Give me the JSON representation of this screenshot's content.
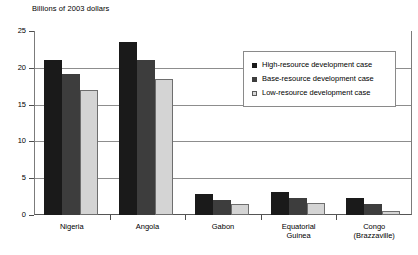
{
  "chart_data": {
    "type": "bar",
    "title": "Billions of 2003 dollars",
    "xlabel": "",
    "ylabel": "Billions of 2003 dollars",
    "ylim": [
      0,
      25
    ],
    "yticks": [
      0,
      5,
      10,
      15,
      20,
      25
    ],
    "grid": true,
    "legend_position": "inside-top-right",
    "categories": [
      "Nigeria",
      "Angola",
      "Gabon",
      "Equatorial\nGuinea",
      "Congo\n(Brazzaville)"
    ],
    "series": [
      {
        "name": "High-resource development case",
        "color": "#1a1a1a",
        "values": [
          21.0,
          23.5,
          2.8,
          3.1,
          2.3
        ]
      },
      {
        "name": "Base-resource development case",
        "color": "#3d3d3d",
        "values": [
          19.1,
          21.0,
          2.0,
          2.3,
          1.5
        ]
      },
      {
        "name": "Low-resource development case",
        "color": "#d4d4d4",
        "values": [
          17.0,
          18.5,
          1.5,
          1.7,
          0.5
        ]
      }
    ]
  }
}
